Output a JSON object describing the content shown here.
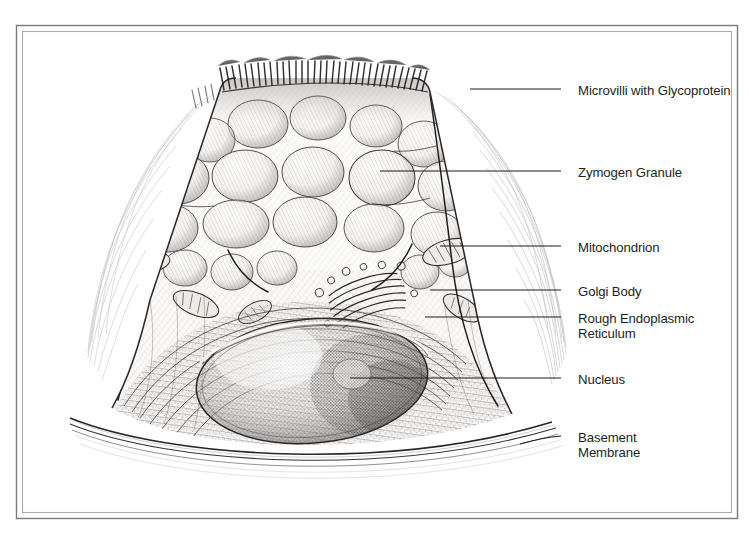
{
  "figure": {
    "page_number": "2",
    "frame": {
      "outer_color": "#7b7876",
      "inner_color": "#a9a6a4",
      "background": "#ffffff"
    },
    "ink_color": "#2b2826",
    "leader_color": "#1c1a19",
    "labels": [
      {
        "id": "microvilli",
        "text": "Microvilli with Glycoprotein",
        "line2": "",
        "x": 578,
        "y": 84,
        "leader_y": 89,
        "leader_x1": 561,
        "leader_x2": 470
      },
      {
        "id": "zymogen",
        "text": "Zymogen Granule",
        "line2": "",
        "x": 578,
        "y": 166,
        "leader_y": 171,
        "leader_x1": 561,
        "leader_x2": 380
      },
      {
        "id": "mitochondrion",
        "text": "Mitochondrion",
        "line2": "",
        "x": 578,
        "y": 241,
        "leader_y": 246,
        "leader_x1": 561,
        "leader_x2": 440
      },
      {
        "id": "golgi",
        "text": "Golgi Body",
        "line2": "",
        "x": 578,
        "y": 285,
        "leader_y": 290,
        "leader_x1": 561,
        "leader_x2": 430
      },
      {
        "id": "rer",
        "text": "Rough Endoplasmic",
        "line2": "Reticulum",
        "x": 578,
        "y": 312,
        "leader_y": 317,
        "leader_x1": 561,
        "leader_x2": 425
      },
      {
        "id": "nucleus",
        "text": "Nucleus",
        "line2": "",
        "x": 578,
        "y": 373,
        "leader_y": 378,
        "leader_x1": 561,
        "leader_x2": 350
      },
      {
        "id": "basement",
        "text": "Basement",
        "line2": "Membrane",
        "x": 578,
        "y": 431,
        "leader_y": 436,
        "leader_x1": 561,
        "leader_x2": 520
      }
    ]
  }
}
